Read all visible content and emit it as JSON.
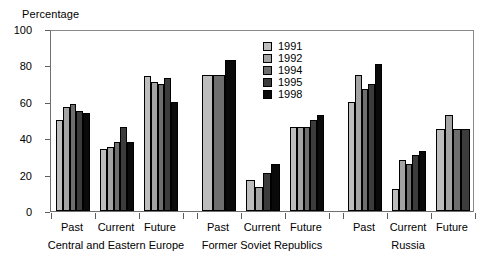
{
  "chart_data": {
    "type": "bar",
    "title": "",
    "xlabel": "",
    "ylabel": "Percentage",
    "ylim": [
      0,
      100
    ],
    "yticks": [
      0,
      20,
      40,
      60,
      80,
      100
    ],
    "grid": false,
    "legend_position": "inside-top-center",
    "categories": [
      "Central and Eastern Europe - Past",
      "Central and Eastern Europe - Current",
      "Central and Eastern Europe - Future",
      "Former Soviet Republics - Past",
      "Former Soviet Republics - Current",
      "Former Soviet Republics - Future",
      "Russia - Past",
      "Russia - Current",
      "Russia - Future"
    ],
    "category_labels": [
      "Past",
      "Current",
      "Future",
      "Past",
      "Current",
      "Future",
      "Past",
      "Current",
      "Future"
    ],
    "group_labels": [
      "Central and Eastern Europe",
      "Former Soviet Republics",
      "Russia"
    ],
    "series": [
      {
        "name": "1991",
        "color": "#bdbdbd",
        "values": [
          50,
          34,
          74,
          75,
          17,
          46,
          60,
          12,
          45
        ]
      },
      {
        "name": "1992",
        "color": "#a3a3a3",
        "values": [
          57,
          35,
          71,
          null,
          13,
          46,
          75,
          28,
          53
        ]
      },
      {
        "name": "1994",
        "color": "#6e6e6e",
        "values": [
          59,
          38,
          70,
          75,
          null,
          46,
          67,
          26,
          45
        ]
      },
      {
        "name": "1995",
        "color": "#3c3c3c",
        "values": [
          55,
          46,
          73,
          null,
          21,
          50,
          70,
          31,
          45
        ]
      },
      {
        "name": "1998",
        "color": "#0a0a0a",
        "values": [
          54,
          38,
          60,
          83,
          26,
          53,
          81,
          33,
          null
        ]
      }
    ]
  },
  "legend": {
    "items": [
      {
        "label": "1991",
        "color": "#bdbdbd"
      },
      {
        "label": "1992",
        "color": "#a3a3a3"
      },
      {
        "label": "1994",
        "color": "#6e6e6e"
      },
      {
        "label": "1995",
        "color": "#3c3c3c"
      },
      {
        "label": "1998",
        "color": "#0a0a0a"
      }
    ]
  },
  "axis": {
    "y_title": "Percentage"
  }
}
